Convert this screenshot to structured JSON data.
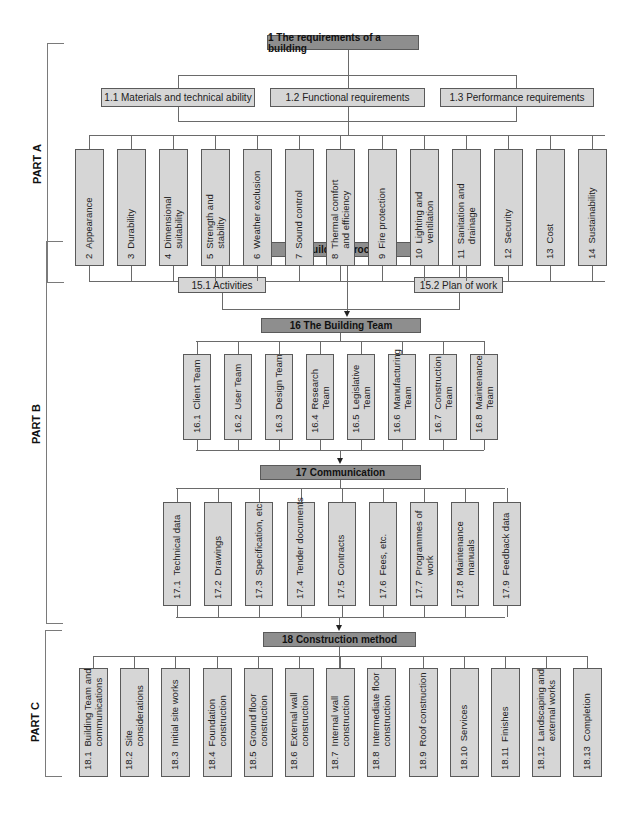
{
  "parts": [
    {
      "label": "PART A"
    },
    {
      "label": "PART B"
    },
    {
      "label": "PART C"
    }
  ],
  "partA": {
    "root": {
      "label": "1  The requirements of a building"
    },
    "subs": [
      {
        "label": "1.1  Materials and technical ability"
      },
      {
        "label": "1.2  Functional requirements"
      },
      {
        "label": "1.3  Performance requirements"
      }
    ],
    "items": [
      {
        "num": "2",
        "label": "Appearance"
      },
      {
        "num": "3",
        "label": "Durability"
      },
      {
        "num": "4",
        "label": "Dimensional\nsuitability"
      },
      {
        "num": "5",
        "label": "Strength and\nstability"
      },
      {
        "num": "6",
        "label": "Weather exclusion"
      },
      {
        "num": "7",
        "label": "Sound control"
      },
      {
        "num": "8",
        "label": "Thermal comfort\nand efficiency"
      },
      {
        "num": "9",
        "label": "Fire protection"
      },
      {
        "num": "10",
        "label": "Lighting and\nventilation"
      },
      {
        "num": "11",
        "label": "Sanitation and\ndrainage"
      },
      {
        "num": "12",
        "label": "Security"
      },
      {
        "num": "13",
        "label": "Cost"
      },
      {
        "num": "14",
        "label": "Sustainability"
      }
    ]
  },
  "partB": {
    "processes": {
      "label": "15  Building processes"
    },
    "process_subs": [
      {
        "label": "15.1  Activities"
      },
      {
        "label": "15.2  Plan of work"
      }
    ],
    "team": {
      "label": "16  The Building Team"
    },
    "team_items": [
      {
        "num": "16.1",
        "label": "Client Team"
      },
      {
        "num": "16.2",
        "label": "User Team"
      },
      {
        "num": "16.3",
        "label": "Design Team"
      },
      {
        "num": "16.4",
        "label": "Research\nTeam"
      },
      {
        "num": "16.5",
        "label": "Legislative\nTeam"
      },
      {
        "num": "16.6",
        "label": "Manufacturing\nTeam"
      },
      {
        "num": "16.7",
        "label": "Construction\nTeam"
      },
      {
        "num": "16.8",
        "label": "Maintenance\nTeam"
      }
    ],
    "communication": {
      "label": "17  Communication"
    },
    "communication_items": [
      {
        "num": "17.1",
        "label": "Technical data"
      },
      {
        "num": "17.2",
        "label": "Drawings"
      },
      {
        "num": "17.3",
        "label": "Specification, etc."
      },
      {
        "num": "17.4",
        "label": "Tender documents"
      },
      {
        "num": "17.5",
        "label": "Contracts"
      },
      {
        "num": "17.6",
        "label": "Fees, etc."
      },
      {
        "num": "17.7",
        "label": "Programmes of\nwork"
      },
      {
        "num": "17.8",
        "label": "Maintenance\nmanuals"
      },
      {
        "num": "17.9",
        "label": "Feedback data"
      }
    ]
  },
  "partC": {
    "construction": {
      "label": "18  Construction method"
    },
    "items": [
      {
        "num": "18.1",
        "label": "Building Team and\ncommunications"
      },
      {
        "num": "18.2",
        "label": "Site\nconsiderations"
      },
      {
        "num": "18.3",
        "label": "Initial site works"
      },
      {
        "num": "18.4",
        "label": "Foundation\nconstruction"
      },
      {
        "num": "18.5",
        "label": "Ground floor\nconstruction"
      },
      {
        "num": "18.6",
        "label": "External wall\nconstruction"
      },
      {
        "num": "18.7",
        "label": "Internal wall\nconstruction"
      },
      {
        "num": "18.8",
        "label": "Intermediate floor\nconstruction"
      },
      {
        "num": "18.9",
        "label": "Roof construction"
      },
      {
        "num": "18.10",
        "label": "Services"
      },
      {
        "num": "18.11",
        "label": "Finishes"
      },
      {
        "num": "18.12",
        "label": "Landscaping and\nexternal works"
      },
      {
        "num": "18.13",
        "label": "Completion"
      }
    ]
  },
  "colors": {
    "header_fill": "#8e8e8e",
    "box_fill": "#d6d6d6",
    "border": "#5a5a5a",
    "line": "#6a6a6a"
  }
}
